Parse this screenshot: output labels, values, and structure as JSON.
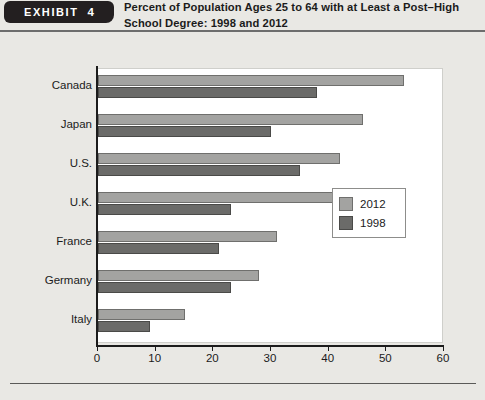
{
  "header": {
    "exhibit_label": "EXHIBIT",
    "exhibit_number": "4",
    "title": "Percent of Population Ages 25 to 64 with at Least a Post–High School Degree: 1998 and 2012"
  },
  "chart_data": {
    "type": "bar",
    "orientation": "horizontal",
    "title": "Percent of Population Ages 25 to 64 with at Least a Post–High School Degree: 1998 and 2012",
    "xlabel": "",
    "ylabel": "",
    "xlim": [
      0,
      60
    ],
    "xticks": [
      0,
      10,
      20,
      30,
      40,
      50,
      60
    ],
    "grid": false,
    "legend_position": "inside-right",
    "categories": [
      "Canada",
      "Japan",
      "U.S.",
      "U.K.",
      "France",
      "Germany",
      "Italy"
    ],
    "series": [
      {
        "name": "2012",
        "color": "#a3a3a1",
        "values": [
          53,
          46,
          42,
          41,
          31,
          28,
          15
        ]
      },
      {
        "name": "1998",
        "color": "#6b6b69",
        "values": [
          38,
          30,
          35,
          23,
          21,
          23,
          9
        ]
      }
    ]
  }
}
